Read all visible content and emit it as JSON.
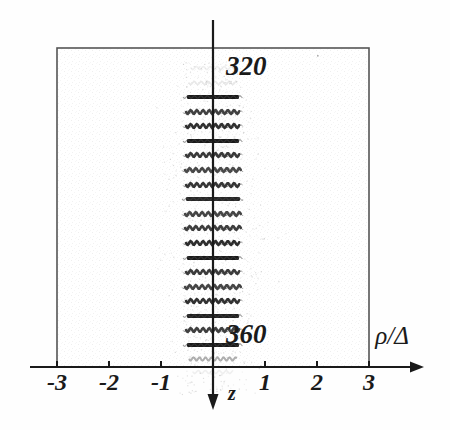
{
  "figure": {
    "name": "wave-packet-density-plot",
    "background_color": "#fefefe",
    "ink_color": "#1a1a1a",
    "frame_color": "#555555",
    "stipple_color": "#d8d8d8"
  },
  "axes": {
    "x_axis": {
      "label": "ρ/Δ",
      "label_x": 392,
      "label_y": 344,
      "line_y": 367,
      "line_x_start": 30,
      "line_x_end": 424,
      "arrow": "right",
      "tick_labels": [
        "-3",
        "-2",
        "-1",
        "1",
        "2",
        "3"
      ],
      "tick_values": [
        -3,
        -2,
        -1,
        1,
        2,
        3
      ],
      "tick_x_positions": [
        57,
        109,
        161,
        265,
        317,
        369
      ],
      "tick_label_y": 390,
      "unit_px": 52,
      "origin_x": 213
    },
    "y_axis": {
      "label": "z",
      "label_x": 232,
      "label_y": 400,
      "line_x": 213,
      "line_y_start": 20,
      "line_y_end": 410,
      "arrow": "down"
    }
  },
  "frame": {
    "left": 57,
    "top": 48,
    "right": 369,
    "bottom": 367
  },
  "annotations": [
    {
      "text": "320",
      "x": 226,
      "y": 75,
      "style": "italic-serif-bold"
    },
    {
      "text": "360",
      "x": 226,
      "y": 343,
      "style": "italic-serif-bold"
    }
  ],
  "chart_data": {
    "type": "heatmap",
    "title": "",
    "xlabel": "ρ/Δ",
    "ylabel": "z",
    "xlim": [
      -3,
      3
    ],
    "grid": false,
    "legend": null,
    "annotation_values": [
      320,
      360
    ],
    "band_count": 19,
    "band_top_y": 97,
    "band_spacing_y": 14.6,
    "bands": [
      {
        "index": 0,
        "y": 97,
        "half_width": 26,
        "intensity": 1.0,
        "kind": "solid"
      },
      {
        "index": 1,
        "y": 112,
        "half_width": 27,
        "intensity": 0.82,
        "kind": "wavy"
      },
      {
        "index": 2,
        "y": 126,
        "half_width": 27,
        "intensity": 0.9,
        "kind": "wavy"
      },
      {
        "index": 3,
        "y": 141,
        "half_width": 26,
        "intensity": 1.0,
        "kind": "solid"
      },
      {
        "index": 4,
        "y": 155,
        "half_width": 27,
        "intensity": 0.86,
        "kind": "wavy"
      },
      {
        "index": 5,
        "y": 170,
        "half_width": 28,
        "intensity": 0.78,
        "kind": "wavy"
      },
      {
        "index": 6,
        "y": 185,
        "half_width": 27,
        "intensity": 0.88,
        "kind": "wavy"
      },
      {
        "index": 7,
        "y": 199,
        "half_width": 27,
        "intensity": 0.95,
        "kind": "solid"
      },
      {
        "index": 8,
        "y": 214,
        "half_width": 28,
        "intensity": 0.8,
        "kind": "wavy"
      },
      {
        "index": 9,
        "y": 228,
        "half_width": 28,
        "intensity": 0.84,
        "kind": "wavy"
      },
      {
        "index": 10,
        "y": 243,
        "half_width": 27,
        "intensity": 0.92,
        "kind": "wavy"
      },
      {
        "index": 11,
        "y": 258,
        "half_width": 26,
        "intensity": 1.0,
        "kind": "solid"
      },
      {
        "index": 12,
        "y": 272,
        "half_width": 27,
        "intensity": 0.85,
        "kind": "wavy"
      },
      {
        "index": 13,
        "y": 287,
        "half_width": 28,
        "intensity": 0.8,
        "kind": "wavy"
      },
      {
        "index": 14,
        "y": 301,
        "half_width": 27,
        "intensity": 0.9,
        "kind": "wavy"
      },
      {
        "index": 15,
        "y": 316,
        "half_width": 26,
        "intensity": 0.97,
        "kind": "solid"
      },
      {
        "index": 16,
        "y": 330,
        "half_width": 27,
        "intensity": 0.83,
        "kind": "wavy"
      },
      {
        "index": 17,
        "y": 345,
        "half_width": 26,
        "intensity": 1.0,
        "kind": "solid"
      },
      {
        "index": 18,
        "y": 359,
        "half_width": 24,
        "intensity": 0.55,
        "kind": "faint"
      }
    ],
    "faint_bands": [
      {
        "y": 68,
        "half_width": 22,
        "intensity": 0.22
      },
      {
        "y": 83,
        "half_width": 24,
        "intensity": 0.3
      },
      {
        "y": 372,
        "half_width": 20,
        "intensity": 0.2
      }
    ]
  }
}
